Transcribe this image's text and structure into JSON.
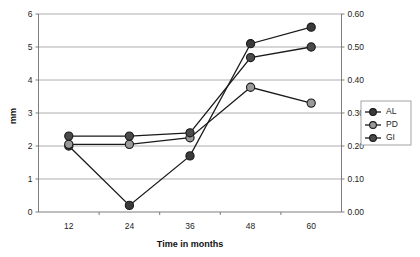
{
  "chart_data": {
    "type": "line",
    "title": "",
    "xlabel": "Time in months",
    "ylabel": "mm",
    "y2label": "",
    "x": [
      12,
      24,
      36,
      48,
      60
    ],
    "categories": [
      "12",
      "24",
      "36",
      "48",
      "60"
    ],
    "xtick_labels": [
      "12",
      "24",
      "36",
      "48",
      "60"
    ],
    "ytick_labels": [
      "0",
      "1",
      "2",
      "3",
      "4",
      "5",
      "6"
    ],
    "y2tick_labels": [
      "0.00",
      "0.10",
      "0.20",
      "0.30",
      "0.40",
      "0.50",
      "0.60"
    ],
    "ylim": [
      0,
      6
    ],
    "y2lim": [
      0.0,
      0.6
    ],
    "grid": true,
    "legend_position": "right",
    "series": [
      {
        "name": "AL",
        "axis": "left",
        "marker": "filled-circle",
        "color": "#3a3a3a",
        "values": [
          2.0,
          0.2,
          1.7,
          5.1,
          5.6
        ]
      },
      {
        "name": "PD",
        "axis": "left",
        "marker": "filled-circle",
        "color": "#9a9a9a",
        "values": [
          2.05,
          2.05,
          2.25,
          3.78,
          3.3
        ]
      },
      {
        "name": "GI",
        "axis": "left",
        "marker": "filled-circle",
        "color": "#4a4a4a",
        "values": [
          2.3,
          2.3,
          2.4,
          4.68,
          5.0
        ]
      }
    ]
  },
  "legend": {
    "entries": [
      {
        "label": "AL",
        "color": "#3a3a3a"
      },
      {
        "label": "PD",
        "color": "#9a9a9a"
      },
      {
        "label": "GI",
        "color": "#4a4a4a"
      }
    ]
  },
  "axes": {
    "x_title": "Time in months",
    "y_title": "mm"
  },
  "colors": {
    "background": "#ffffff",
    "gridline": "#9a9a9a",
    "axis": "#6f6f6f",
    "line": "#1a1a1a",
    "marker_dark": "#3a3a3a",
    "marker_mid": "#4a4a4a",
    "marker_light": "#9a9a9a"
  }
}
